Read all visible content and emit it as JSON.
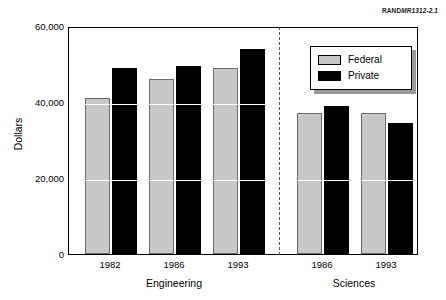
{
  "source_tag": {
    "prefix": "RAND",
    "code": "MR1312-2.1"
  },
  "legend": {
    "position": "top-right-inside",
    "entries": [
      {
        "label": "Federal",
        "color": "#c8c8c8"
      },
      {
        "label": "Private",
        "color": "#000000"
      }
    ]
  },
  "chart_data": {
    "type": "bar",
    "title": "",
    "subtitle": "",
    "xlabel": "",
    "ylabel": "Dollars",
    "ylim": [
      0,
      60000
    ],
    "yticks": [
      0,
      20000,
      40000,
      60000
    ],
    "ytick_labels": [
      "0",
      "20,000",
      "40,000",
      "60,000"
    ],
    "grid": false,
    "legend_position": "top-right-inside",
    "groups": [
      {
        "name": "Engineering",
        "categories": [
          "1982",
          "1986",
          "1993"
        ]
      },
      {
        "name": "Sciences",
        "categories": [
          "1986",
          "1993"
        ]
      }
    ],
    "categories": [
      "1982",
      "1986",
      "1993",
      "1986",
      "1993"
    ],
    "series": [
      {
        "name": "Federal",
        "color": "#c8c8c8",
        "values": [
          41000,
          46000,
          49000,
          37000,
          37000
        ]
      },
      {
        "name": "Private",
        "color": "#000000",
        "values": [
          49000,
          49500,
          54000,
          39000,
          34500
        ]
      }
    ]
  }
}
